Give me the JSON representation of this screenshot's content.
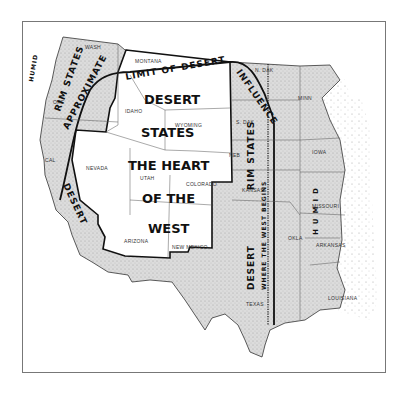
{
  "map": {
    "title_labels": {
      "approx_limit": "APPROXIMATE LIMIT OF DESERT INFLUENCE",
      "approx_part1": "APPROXIMATE",
      "approx_part2": "LIMIT OF DESERT",
      "approx_part3": "INFLUENCE",
      "desert_states_1": "DESERT",
      "desert_states_2": "STATES",
      "heart_1": "THE HEART",
      "heart_2": "OF THE",
      "heart_3": "WEST",
      "west_rim_1": "RIM STATES",
      "west_rim_2": "DESERT",
      "east_rim_1": "RIM STATES",
      "east_rim_2": "DESERT",
      "where_west_begins": "WHERE THE WEST BEGINS",
      "humid_west": "HUMID",
      "humid_east": "HUMID"
    },
    "states": {
      "wash": "WASH",
      "ore": "ORE",
      "cal": "CAL",
      "nevada": "NEVADA",
      "idaho": "IDAHO",
      "montana": "MONTANA",
      "wyoming": "WYOMING",
      "utah": "UTAH",
      "colorado": "COLORADO",
      "arizona": "ARIZONA",
      "new_mexico": "NEW MEXICO",
      "n_dak": "N. DAK",
      "s_dak": "S. DAK",
      "neb": "NEB",
      "kansas": "KANSAS",
      "okla": "OKLA",
      "texas": "TEXAS",
      "minn": "MINN",
      "iowa": "IOWA",
      "missouri": "MISSOURI",
      "arkansas": "ARKANSAS",
      "louisiana": "LOUISIANA"
    },
    "colors": {
      "rim_fill": "#d9d9d9",
      "humid_fill": "#e2e2e2",
      "heart_fill": "#ffffff",
      "outline": "#111111"
    }
  }
}
